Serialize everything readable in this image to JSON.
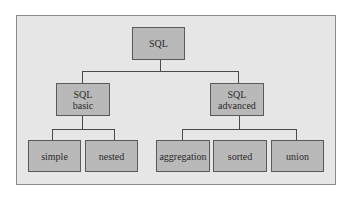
{
  "diagram": {
    "type": "tree",
    "root": {
      "label": "SQL"
    },
    "level1": [
      {
        "line1": "SQL",
        "line2": "basic"
      },
      {
        "line1": "SQL",
        "line2": "advanced"
      }
    ],
    "leaves_basic": [
      {
        "label": "simple"
      },
      {
        "label": "nested"
      }
    ],
    "leaves_advanced": [
      {
        "label": "aggregation"
      },
      {
        "label": "sorted"
      },
      {
        "label": "union"
      }
    ],
    "colors": {
      "frame_bg": "#e6e6e6",
      "node_fill": "#b9b9b9",
      "border": "#5a5a5a"
    }
  }
}
